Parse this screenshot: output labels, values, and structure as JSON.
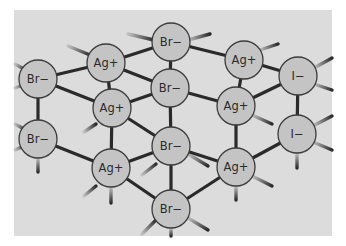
{
  "diagram": {
    "title": "",
    "type": "crystal-lattice",
    "colors": {
      "background": "#ffffff",
      "panel": "#dcdcdc",
      "ion_fill": "#c4c4c4",
      "ion_stroke": "#3c3c3c",
      "bond": "#2a2a2a",
      "text": "#2a2a2a"
    },
    "ions": [
      {
        "id": "br1",
        "label": "Br−",
        "x": 38,
        "y": 79,
        "r": 19
      },
      {
        "id": "br2",
        "label": "Br−",
        "x": 38,
        "y": 139,
        "r": 19
      },
      {
        "id": "ag1",
        "label": "Ag+",
        "x": 106,
        "y": 63,
        "r": 19
      },
      {
        "id": "ag2",
        "label": "Ag+",
        "x": 112,
        "y": 108,
        "r": 19
      },
      {
        "id": "ag3",
        "label": "Ag+",
        "x": 111,
        "y": 168,
        "r": 19
      },
      {
        "id": "br3",
        "label": "Br−",
        "x": 171,
        "y": 42,
        "r": 19
      },
      {
        "id": "br4",
        "label": "Br−",
        "x": 170,
        "y": 88,
        "r": 19
      },
      {
        "id": "br5",
        "label": "Br−",
        "x": 171,
        "y": 146,
        "r": 19
      },
      {
        "id": "br6",
        "label": "Br−",
        "x": 171,
        "y": 209,
        "r": 19
      },
      {
        "id": "ag4",
        "label": "Ag+",
        "x": 244,
        "y": 60,
        "r": 19
      },
      {
        "id": "ag5",
        "label": "Ag+",
        "x": 236,
        "y": 106,
        "r": 19
      },
      {
        "id": "ag6",
        "label": "Ag+",
        "x": 236,
        "y": 167,
        "r": 19
      },
      {
        "id": "i1",
        "label": "I−",
        "x": 298,
        "y": 76,
        "r": 19
      },
      {
        "id": "i2",
        "label": "I−",
        "x": 297,
        "y": 134,
        "r": 19
      }
    ],
    "bonds": [
      [
        "br1",
        "ag1"
      ],
      [
        "br1",
        "ag2"
      ],
      [
        "br1",
        "br2"
      ],
      [
        "br2",
        "ag3"
      ],
      [
        "ag1",
        "br3"
      ],
      [
        "ag1",
        "br4"
      ],
      [
        "ag1",
        "ag2"
      ],
      [
        "ag2",
        "br4"
      ],
      [
        "ag2",
        "br5"
      ],
      [
        "ag2",
        "ag3"
      ],
      [
        "ag3",
        "br5"
      ],
      [
        "ag3",
        "br6"
      ],
      [
        "br3",
        "ag4"
      ],
      [
        "br3",
        "br4"
      ],
      [
        "br4",
        "ag5"
      ],
      [
        "br4",
        "br5"
      ],
      [
        "br5",
        "ag6"
      ],
      [
        "br5",
        "br6"
      ],
      [
        "br6",
        "ag6"
      ],
      [
        "ag4",
        "ag5"
      ],
      [
        "ag4",
        "i1"
      ],
      [
        "ag5",
        "i1"
      ],
      [
        "ag5",
        "ag6"
      ],
      [
        "ag6",
        "i2"
      ],
      [
        "i1",
        "i2"
      ]
    ],
    "stubs": [
      {
        "x1": 15,
        "y1": 64,
        "x2": 26,
        "y2": 70
      },
      {
        "x1": 15,
        "y1": 88,
        "x2": 26,
        "y2": 84
      },
      {
        "x1": 15,
        "y1": 124,
        "x2": 26,
        "y2": 130
      },
      {
        "x1": 15,
        "y1": 150,
        "x2": 26,
        "y2": 145
      },
      {
        "x1": 38,
        "y1": 158,
        "x2": 38,
        "y2": 172
      },
      {
        "x1": 68,
        "y1": 46,
        "x2": 90,
        "y2": 55
      },
      {
        "x1": 84,
        "y1": 132,
        "x2": 96,
        "y2": 124
      },
      {
        "x1": 84,
        "y1": 196,
        "x2": 96,
        "y2": 186
      },
      {
        "x1": 111,
        "y1": 187,
        "x2": 111,
        "y2": 203
      },
      {
        "x1": 128,
        "y1": 34,
        "x2": 154,
        "y2": 40
      },
      {
        "x1": 188,
        "y1": 40,
        "x2": 210,
        "y2": 34
      },
      {
        "x1": 142,
        "y1": 175,
        "x2": 156,
        "y2": 164
      },
      {
        "x1": 188,
        "y1": 154,
        "x2": 208,
        "y2": 166
      },
      {
        "x1": 142,
        "y1": 234,
        "x2": 156,
        "y2": 220
      },
      {
        "x1": 188,
        "y1": 218,
        "x2": 208,
        "y2": 230
      },
      {
        "x1": 171,
        "y1": 228,
        "x2": 171,
        "y2": 236
      },
      {
        "x1": 260,
        "y1": 50,
        "x2": 278,
        "y2": 44
      },
      {
        "x1": 252,
        "y1": 115,
        "x2": 272,
        "y2": 124
      },
      {
        "x1": 252,
        "y1": 176,
        "x2": 272,
        "y2": 186
      },
      {
        "x1": 236,
        "y1": 186,
        "x2": 236,
        "y2": 200
      },
      {
        "x1": 314,
        "y1": 68,
        "x2": 332,
        "y2": 58
      },
      {
        "x1": 314,
        "y1": 84,
        "x2": 332,
        "y2": 90
      },
      {
        "x1": 313,
        "y1": 126,
        "x2": 332,
        "y2": 116
      },
      {
        "x1": 313,
        "y1": 142,
        "x2": 332,
        "y2": 150
      },
      {
        "x1": 297,
        "y1": 153,
        "x2": 297,
        "y2": 168
      }
    ],
    "panel": {
      "x": 14,
      "y": 10,
      "width": 318,
      "height": 226
    }
  }
}
